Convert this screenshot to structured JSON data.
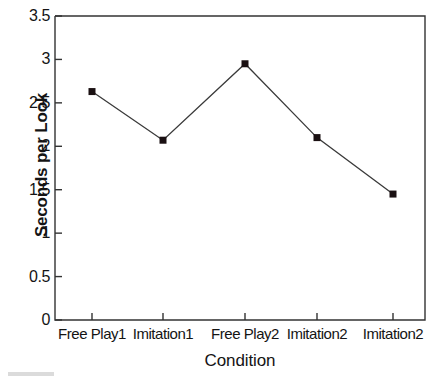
{
  "chart_data": {
    "type": "line",
    "title": "",
    "subtitle": "",
    "xlabel": "Condition",
    "ylabel": "Seconds per Look",
    "categories": [
      "Free Play1",
      "Imitation1",
      "Free Play2",
      "Imitation2",
      "Imitation2"
    ],
    "values": [
      2.63,
      2.07,
      2.95,
      2.1,
      1.45
    ],
    "series": [
      {
        "name": "Seconds per Look",
        "values": [
          2.63,
          2.07,
          2.95,
          2.1,
          1.45
        ]
      }
    ],
    "ylim": [
      0,
      3.5
    ],
    "yticks": [
      0,
      0.5,
      1,
      1.5,
      2,
      2.5,
      3,
      3.5
    ],
    "ytick_labels": [
      "0",
      "0.5",
      "1",
      "1.5",
      "2",
      "2.5",
      "3",
      "3.5"
    ],
    "grid": false,
    "legend": "none",
    "marker": "square",
    "marker_color": "#1a1012",
    "line_color": "#3a3a3a",
    "axis_color": "#333333",
    "background": "#ffffff"
  }
}
